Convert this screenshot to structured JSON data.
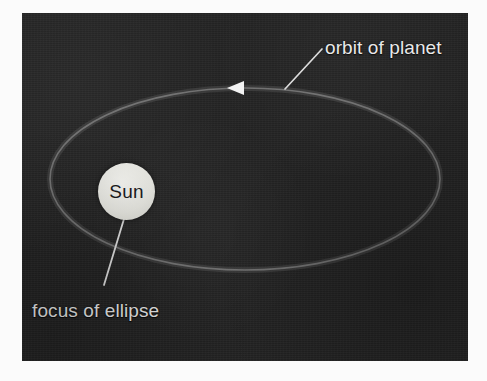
{
  "figure": {
    "kind": "astronomy-diagram",
    "background_color": "#232323",
    "page_color": "#fbfbfb",
    "ink_color": "#e9e9e9"
  },
  "labels": {
    "orbit": "orbit of planet",
    "focus": "focus of ellipse",
    "sun": "Sun"
  },
  "icons": {
    "direction_marker": "left-pointing-triangle-arrowhead",
    "orbit_path": "ellipse-outline",
    "sun_body": "filled-circle"
  },
  "geometry": {
    "plate": {
      "x": 22,
      "y": 13,
      "width": 446,
      "height": 348
    },
    "ellipse": {
      "cx": 245,
      "cy": 179,
      "rx": 195,
      "ry": 91
    },
    "sun": {
      "cx": 104,
      "cy": 179,
      "r": 28
    },
    "arrow": {
      "x": 232,
      "y": 86,
      "points": "left"
    },
    "leader_orbit": {
      "x1": 285,
      "y1": 88,
      "x2": 322,
      "y2": 48
    },
    "leader_focus": {
      "x1": 104,
      "y1": 208,
      "x2": 73,
      "y2": 283
    }
  },
  "colors": {
    "orbit_stroke": "#6f6f6f",
    "leader_stroke": "#d9d9d9",
    "arrow_fill": "#f2f2f2",
    "sun_fill": "#e9e9e3",
    "sun_text": "#17171a"
  }
}
